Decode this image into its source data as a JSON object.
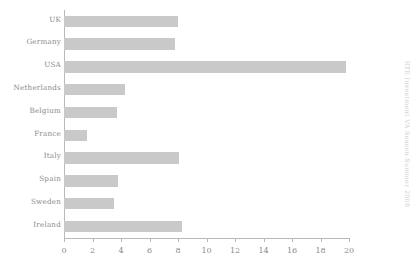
{
  "chart_data": {
    "type": "bar",
    "orientation": "horizontal",
    "title": "",
    "xlabel": "",
    "ylabel": "",
    "categories": [
      "UK",
      "Germany",
      "USA",
      "Netherlands",
      "Belgium",
      "France",
      "Italy",
      "Spain",
      "Sweden",
      "Ireland"
    ],
    "values": [
      8.0,
      7.8,
      19.8,
      4.3,
      3.7,
      1.6,
      8.1,
      3.8,
      3.5,
      8.3
    ],
    "xlim": [
      0,
      20
    ],
    "xticks": [
      0,
      2,
      4,
      6,
      8,
      10,
      12,
      14,
      16,
      18,
      20
    ],
    "xtick_labels": [
      "0",
      "2",
      "4",
      "6",
      "8",
      "10",
      "12",
      "14",
      "16",
      "18",
      "20"
    ],
    "grid": false,
    "legend": null,
    "bar_color": "#c9c9c9",
    "axis_color": "#b9b9b9",
    "text_color": "#8a8a8a"
  },
  "side_caption": {
    "text": "RTE Investment VA Season Summer 2008",
    "color": "#cfcfcf"
  }
}
